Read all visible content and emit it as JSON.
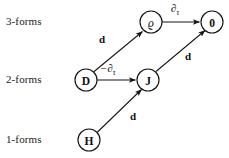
{
  "figure": {
    "type": "commutative-diagram",
    "background_color": "#ffffff",
    "ink_color": "#151515"
  },
  "row_labels": [
    {
      "id": "3-forms",
      "text": "3-forms"
    },
    {
      "id": "2-forms",
      "text": "2-forms"
    },
    {
      "id": "1-forms",
      "text": "1-forms"
    }
  ],
  "nodes": [
    {
      "id": "rho",
      "label": "ϱ",
      "row": "3-forms",
      "cx": 151,
      "cy": 22,
      "r": 11,
      "style": "italic"
    },
    {
      "id": "zero",
      "label": "0",
      "row": "3-forms",
      "cx": 212,
      "cy": 22,
      "r": 11,
      "style": "bold"
    },
    {
      "id": "D",
      "label": "D",
      "row": "2-forms",
      "cx": 86,
      "cy": 80,
      "r": 11,
      "style": "bold"
    },
    {
      "id": "J",
      "label": "J",
      "row": "2-forms",
      "cx": 148,
      "cy": 80,
      "r": 11,
      "style": "bold"
    },
    {
      "id": "H",
      "label": "H",
      "row": "1-forms",
      "cx": 89,
      "cy": 140,
      "r": 11,
      "style": "bold"
    }
  ],
  "edges": [
    {
      "id": "rho-to-zero",
      "from": "rho",
      "to": "zero",
      "label": "∂",
      "label_sub": "τ",
      "label_full": "∂τ",
      "label_kind": "operator"
    },
    {
      "id": "D-to-J",
      "from": "D",
      "to": "J",
      "label": "−∂",
      "label_sub": "τ",
      "label_full": "−∂τ",
      "label_kind": "operator"
    },
    {
      "id": "D-to-rho",
      "from": "D",
      "to": "rho",
      "label": "d",
      "label_full": "d",
      "label_kind": "exterior-derivative"
    },
    {
      "id": "J-to-zero",
      "from": "J",
      "to": "zero",
      "label": "d",
      "label_full": "d",
      "label_kind": "exterior-derivative"
    },
    {
      "id": "H-to-J",
      "from": "H",
      "to": "J",
      "label": "d",
      "label_full": "d",
      "label_kind": "exterior-derivative"
    }
  ],
  "edge_labels": {
    "d_left": "d",
    "d_right": "d",
    "d_bottom": "d",
    "dtau_top_main": "∂",
    "dtau_top_sub": "τ",
    "dtau_mid_main": "−∂",
    "dtau_mid_sub": "τ"
  }
}
